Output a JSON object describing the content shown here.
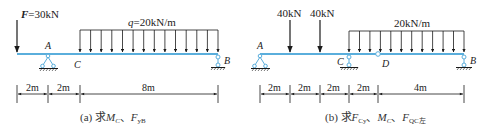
{
  "colors": {
    "beam": "#5aaedc",
    "ink": "#1a1a1a",
    "background": "#ffffff"
  },
  "diagram_a": {
    "force_label": "F=30kN",
    "force_symbol": "F",
    "force_value": "=30kN",
    "dist_load_label_symbol": "q",
    "dist_load_label_value": "=20kN/m",
    "points": {
      "A": "A",
      "B": "B",
      "C": "C"
    },
    "dimensions": [
      "2m",
      "2m",
      "8m"
    ],
    "caption_prefix": "(a) 求",
    "caption_m": "M",
    "caption_m_sub": "C",
    "caption_sep": "、",
    "caption_f": "F",
    "caption_f_sub": "yB"
  },
  "diagram_b": {
    "point_loads": [
      "40kN",
      "40kN"
    ],
    "dist_load_label": "20kN/m",
    "points": {
      "A": "A",
      "B": "B",
      "C": "C",
      "D": "D"
    },
    "dimensions": [
      "2m",
      "2m",
      "2m",
      "2m",
      "4m"
    ],
    "caption_prefix": "(b) 求",
    "caption_f1": "F",
    "caption_f1_sub": "Cy",
    "caption_sep1": "、",
    "caption_m": "M",
    "caption_m_sub": "C",
    "caption_sep2": "、",
    "caption_f2": "F",
    "caption_f2_sub": "QC左"
  }
}
